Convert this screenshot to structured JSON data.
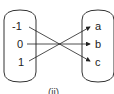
{
  "diagram": {
    "type": "mapping",
    "domain": [
      "-1",
      "0",
      "1"
    ],
    "codomain": [
      "a",
      "b",
      "c"
    ],
    "mappings": [
      {
        "from": "-1",
        "to": "c"
      },
      {
        "from": "0",
        "to": "b"
      },
      {
        "from": "1",
        "to": "a"
      }
    ],
    "caption": "(ii)"
  }
}
